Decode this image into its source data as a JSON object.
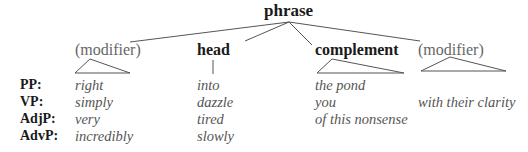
{
  "diagram": {
    "root": "phrase",
    "constituents": [
      {
        "label": "(modifier)",
        "style": "plain"
      },
      {
        "label": "head",
        "style": "bold"
      },
      {
        "label": "complement",
        "style": "bold"
      },
      {
        "label": "(modifier)",
        "style": "plain"
      }
    ],
    "rows": [
      {
        "type": "PP:",
        "modifier": "right",
        "head": "into",
        "complement": "the pond",
        "modifier2": ""
      },
      {
        "type": "VP:",
        "modifier": "simply",
        "head": "dazzle",
        "complement": "you",
        "modifier2": "with their clarity"
      },
      {
        "type": "AdjP:",
        "modifier": "very",
        "head": "tired",
        "complement": "of this nonsense",
        "modifier2": ""
      },
      {
        "type": "AdvP:",
        "modifier": "incredibly",
        "head": "slowly",
        "complement": "",
        "modifier2": ""
      }
    ],
    "colors": {
      "line": "#555555",
      "bold_text": "#1a1a1a",
      "example_text": "#555555",
      "modifier_label": "#666666"
    }
  }
}
